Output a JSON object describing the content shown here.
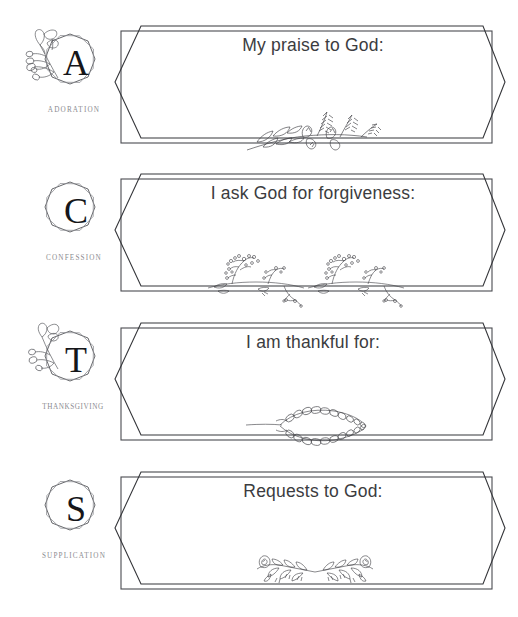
{
  "page": {
    "background_color": "#ffffff",
    "ink_color": "#3b3c40",
    "label_color": "#8b8b90"
  },
  "sections": [
    {
      "letter": "A",
      "label": "ADORATION",
      "heading": "My praise to God:",
      "badge_icon": "double-octagon-emblem-icon",
      "sprig_icon": "floral-sprig-wheat-icon",
      "answer_value": ""
    },
    {
      "letter": "C",
      "label": "CONFESSION",
      "heading": "I ask God for forgiveness:",
      "badge_icon": "double-octagon-emblem-icon",
      "sprig_icon": "floral-sprig-babysbreath-icon",
      "answer_value": ""
    },
    {
      "letter": "T",
      "label": "THANKSGIVING",
      "heading": "I am thankful for:",
      "badge_icon": "double-octagon-emblem-icon",
      "sprig_icon": "floral-sprig-eucalyptus-icon",
      "answer_value": ""
    },
    {
      "letter": "S",
      "label": "SUPPLICATION",
      "heading": "Requests to God:",
      "badge_icon": "double-octagon-emblem-icon",
      "sprig_icon": "floral-sprig-rose-icon",
      "answer_value": ""
    }
  ]
}
